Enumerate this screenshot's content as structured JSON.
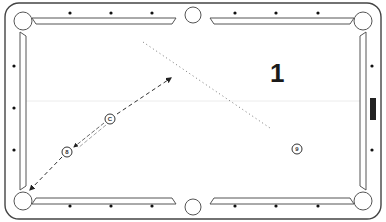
{
  "diagram": {
    "shot_number": "1",
    "colors": {
      "line": "#333333",
      "rail": "#555555",
      "diamond": "#111111",
      "marker": "#222222",
      "background": "#ffffff"
    },
    "balls": [
      {
        "id": "cue",
        "label": "C",
        "x": 110,
        "y": 119
      },
      {
        "id": "object-8",
        "label": "8",
        "x": 67,
        "y": 152
      },
      {
        "id": "object-9",
        "label": "9",
        "x": 297,
        "y": 149
      }
    ],
    "paths": [
      {
        "name": "cue-ball-path",
        "style": "dashed",
        "from": [
          117,
          113
        ],
        "to": [
          172,
          77
        ]
      },
      {
        "name": "cue-to-8-path",
        "style": "double-dashed",
        "from": [
          103,
          124
        ],
        "to": [
          72,
          148
        ]
      },
      {
        "name": "8-ball-to-pocket-path",
        "style": "dashed",
        "from": [
          62,
          157
        ],
        "to": [
          30,
          190
        ]
      },
      {
        "name": "reference-line",
        "style": "dotted",
        "from": [
          143,
          42
        ],
        "to": [
          270,
          128
        ]
      }
    ],
    "diamonds": {
      "top": [
        [
          70,
          14
        ],
        [
          111,
          14
        ],
        [
          152,
          14
        ],
        [
          235,
          14
        ],
        [
          276,
          14
        ],
        [
          318,
          14
        ]
      ],
      "bottom": [
        [
          70,
          206
        ],
        [
          111,
          206
        ],
        [
          152,
          206
        ],
        [
          235,
          206
        ],
        [
          276,
          206
        ],
        [
          318,
          206
        ]
      ],
      "left": [
        [
          14,
          66
        ],
        [
          14,
          108
        ],
        [
          14,
          150
        ]
      ],
      "right": [
        [
          372,
          66
        ],
        [
          372,
          150
        ]
      ]
    },
    "rail_marker": {
      "x": 370,
      "y": 98,
      "width": 6,
      "height": 22
    }
  }
}
